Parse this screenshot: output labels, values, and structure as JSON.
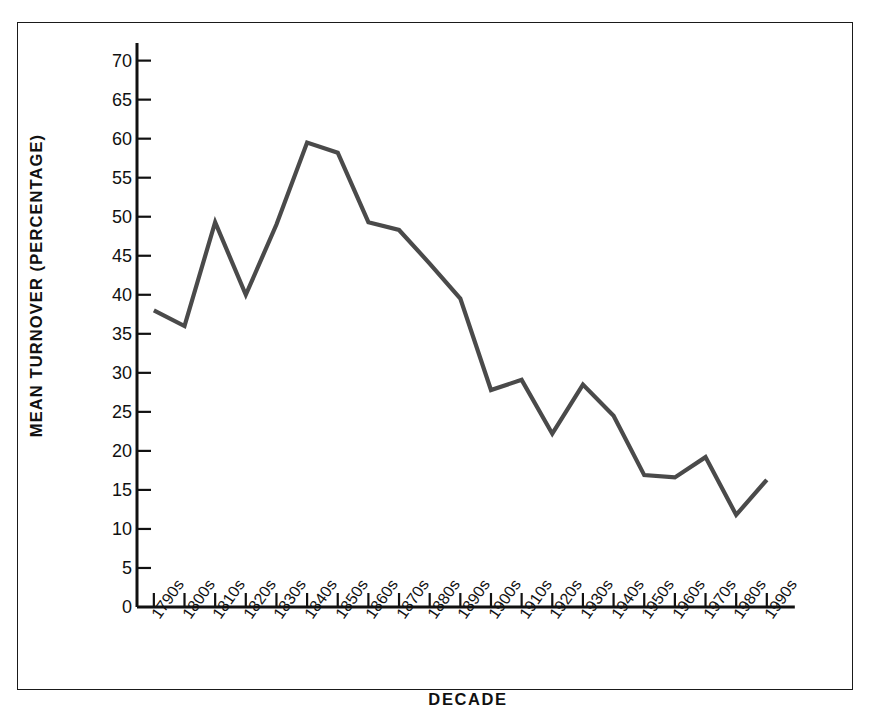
{
  "figure": {
    "border_color": "#1a1a1a",
    "background": "#ffffff"
  },
  "chart_data": {
    "type": "line",
    "title": "",
    "xlabel": "DECADE",
    "ylabel": "MEAN TURNOVER (PERCENTAGE)",
    "categories": [
      "1790s",
      "1800s",
      "1810s",
      "1820s",
      "1830s",
      "1840s",
      "1850s",
      "1860s",
      "1870s",
      "1880s",
      "1890s",
      "1900s",
      "1910s",
      "1920s",
      "1930s",
      "1940s",
      "1950s",
      "1960s",
      "1970s",
      "1980s",
      "1990s"
    ],
    "values": [
      38.0,
      36.0,
      49.3,
      40.0,
      49.0,
      59.5,
      58.2,
      49.3,
      48.3,
      44.0,
      39.5,
      27.8,
      29.1,
      22.2,
      28.5,
      24.5,
      16.9,
      16.6,
      19.2,
      11.8,
      16.3
    ],
    "ylim": [
      0,
      72
    ],
    "xlim": [
      0,
      20
    ],
    "yticks": [
      0,
      5,
      10,
      15,
      20,
      25,
      30,
      35,
      40,
      45,
      50,
      55,
      60,
      65,
      70
    ],
    "ytick_labels": [
      "0",
      "5",
      "10",
      "15",
      "20",
      "25",
      "30",
      "35",
      "40",
      "45",
      "50",
      "55",
      "60",
      "65",
      "70"
    ],
    "grid": false,
    "legend": null,
    "legend_position": "none",
    "series_color": "#4a4a4a",
    "axis_color": "#111111",
    "line_width": 4.2
  }
}
